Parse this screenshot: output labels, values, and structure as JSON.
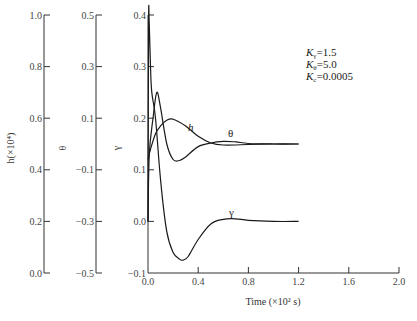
{
  "chart_data": {
    "type": "line",
    "title": "",
    "xlabel": "Time (×10² s)",
    "xlim": [
      0.0,
      2.0
    ],
    "x_ticks": [
      "0.0",
      "0.4",
      "0.8",
      "1.2",
      "1.6",
      "2.0"
    ],
    "grid": false,
    "legend_position": "inline labels",
    "parameters": [
      {
        "symbol": "K",
        "sub": "γ",
        "value": "=1.5"
      },
      {
        "symbol": "K",
        "sub": "θ",
        "value": "=5.0"
      },
      {
        "symbol": "K",
        "sub": "c",
        "value": "=0.0005"
      }
    ],
    "y_axes": [
      {
        "name": "h",
        "label": "h(×10⁴)",
        "ylim": [
          0.0,
          1.0
        ],
        "ticks": [
          "1.0",
          "0.8",
          "0.6",
          "0.4",
          "0.2",
          "0.0"
        ]
      },
      {
        "name": "theta",
        "label": "θ",
        "ylim": [
          -0.5,
          0.5
        ],
        "ticks": [
          "0.5",
          "0.3",
          "0.1",
          "−0.1",
          "−0.3",
          "−0.5"
        ]
      },
      {
        "name": "gamma",
        "label": "γ",
        "ylim": [
          -0.1,
          0.4
        ],
        "ticks": [
          "0.4",
          "0.3",
          "0.2",
          "0.1",
          "0.0",
          "−0.1"
        ]
      }
    ],
    "series": [
      {
        "name": "h",
        "label": "h",
        "note": "values in main-plot (γ) scale",
        "x": [
          0.0,
          0.02,
          0.06,
          0.1,
          0.15,
          0.2,
          0.3,
          0.4,
          0.5,
          0.6,
          0.8,
          1.0,
          1.2
        ],
        "values": [
          0.12,
          0.14,
          0.17,
          0.185,
          0.196,
          0.198,
          0.185,
          0.165,
          0.152,
          0.148,
          0.149,
          0.15,
          0.15
        ]
      },
      {
        "name": "theta",
        "label": "θ",
        "x": [
          0.0,
          0.01,
          0.04,
          0.07,
          0.1,
          0.15,
          0.2,
          0.25,
          0.3,
          0.4,
          0.5,
          0.6,
          0.7,
          0.8,
          1.0,
          1.2
        ],
        "values": [
          0.0,
          0.13,
          0.2,
          0.25,
          0.22,
          0.15,
          0.12,
          0.118,
          0.125,
          0.145,
          0.152,
          0.155,
          0.154,
          0.151,
          0.15,
          0.15
        ]
      },
      {
        "name": "gamma",
        "label": "γ",
        "x": [
          0.0,
          0.005,
          0.01,
          0.02,
          0.03,
          0.06,
          0.1,
          0.15,
          0.2,
          0.25,
          0.28,
          0.32,
          0.4,
          0.5,
          0.6,
          0.7,
          0.8,
          1.0,
          1.2
        ],
        "values": [
          0.0,
          0.39,
          0.38,
          0.3,
          0.25,
          0.2,
          0.08,
          -0.02,
          -0.06,
          -0.073,
          -0.075,
          -0.068,
          -0.035,
          -0.005,
          0.004,
          0.005,
          0.002,
          0.0,
          0.0
        ]
      }
    ]
  },
  "labels": {
    "h_axis": "h(×10⁴)",
    "theta_axis": "θ",
    "gamma_axis": "γ",
    "x_axis": "Time (×10² s)",
    "h_curve": "h",
    "theta_curve": "θ",
    "gamma_curve": "γ"
  }
}
